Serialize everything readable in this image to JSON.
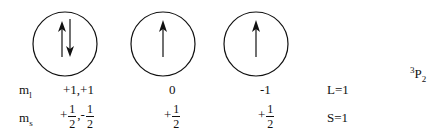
{
  "diagram": {
    "orbitals": [
      {
        "cx": 65,
        "cy": 44,
        "r": 32,
        "electrons": [
          "up",
          "down"
        ],
        "ml": "+1,+1",
        "ms": [
          {
            "sign": "+",
            "num": "1",
            "den": "2"
          },
          {
            "sign": ",-",
            "num": "1",
            "den": "2"
          }
        ]
      },
      {
        "cx": 163,
        "cy": 44,
        "r": 32,
        "electrons": [
          "up"
        ],
        "ml": "0",
        "ms": [
          {
            "sign": "+",
            "num": "1",
            "den": "2"
          }
        ]
      },
      {
        "cx": 256,
        "cy": 44,
        "r": 32,
        "electrons": [
          "up"
        ],
        "ml": "-1",
        "ms": [
          {
            "sign": "+",
            "num": "1",
            "den": "2"
          }
        ]
      }
    ],
    "row_labels": {
      "ml": {
        "base": "m",
        "sub": "l"
      },
      "ms": {
        "base": "m",
        "sub": "s"
      }
    },
    "totals": {
      "L": "L=1",
      "S": "S=1"
    },
    "term_symbol": {
      "sup": "3",
      "base": "P",
      "sub": "2"
    }
  }
}
